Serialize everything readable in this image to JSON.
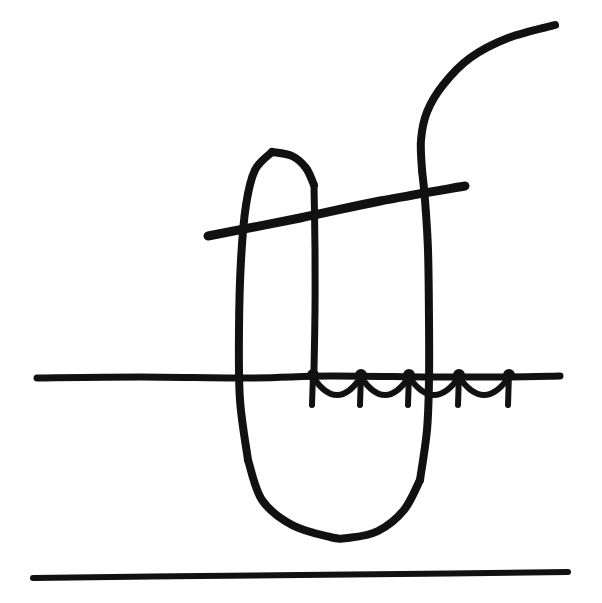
{
  "image": {
    "kind": "hand-drawn-sketch",
    "title": "Hand-drawn line sketch",
    "width": 602,
    "height": 603,
    "background_color": "#ffffff",
    "ink_color": "#111111",
    "text_content": "",
    "visible_labels": []
  },
  "chart_data": {
    "type": "line",
    "title": "",
    "xlabel": "",
    "ylabel": "",
    "grid": false,
    "legend": "none",
    "xlim": [
      0,
      602
    ],
    "ylim": [
      0,
      603
    ],
    "note": "Monochrome freehand ink drawing; no numeric axes, ticks, or labels are rendered in the image.",
    "strokes": [
      {
        "name": "ground-line",
        "description": "long near-horizontal baseline crossing the full width at mid height",
        "stroke_width": 7,
        "points": [
          [
            37,
            378
          ],
          [
            140,
            377
          ],
          [
            250,
            378
          ],
          [
            330,
            376
          ],
          [
            430,
            377
          ],
          [
            500,
            377
          ],
          [
            560,
            376
          ]
        ]
      },
      {
        "name": "bottom-line",
        "description": "straight horizontal rule near the bottom edge",
        "stroke_width": 6,
        "points": [
          [
            33,
            578
          ],
          [
            200,
            576
          ],
          [
            400,
            574
          ],
          [
            568,
            572
          ]
        ]
      },
      {
        "name": "slanted-line",
        "description": "thick line rising gently from lower-left to upper-right across the upper middle",
        "stroke_width": 9,
        "points": [
          [
            208,
            236
          ],
          [
            300,
            218
          ],
          [
            380,
            201
          ],
          [
            465,
            186
          ]
        ]
      },
      {
        "name": "u-loop-left",
        "description": "left flank of the tall narrow loop, from the rounded top apex down past the ground line",
        "stroke_width": 8,
        "points": [
          [
            272,
            152
          ],
          [
            255,
            170
          ],
          [
            246,
            205
          ],
          [
            241,
            260
          ],
          [
            239,
            330
          ],
          [
            240,
            400
          ],
          [
            248,
            460
          ]
        ]
      },
      {
        "name": "u-loop-bottom",
        "description": "rounded bottom of the tall loop",
        "stroke_width": 8,
        "points": [
          [
            248,
            460
          ],
          [
            262,
            500
          ],
          [
            292,
            525
          ],
          [
            330,
            537
          ],
          [
            348,
            538
          ],
          [
            378,
            531
          ],
          [
            404,
            510
          ],
          [
            420,
            480
          ]
        ]
      },
      {
        "name": "u-loop-right",
        "description": "right flank of the loop rising back up, continuing as the long vertical",
        "stroke_width": 8,
        "points": [
          [
            420,
            480
          ],
          [
            427,
            430
          ],
          [
            429,
            380
          ],
          [
            429,
            320
          ],
          [
            428,
            250
          ],
          [
            425,
            200
          ],
          [
            422,
            170
          ]
        ]
      },
      {
        "name": "inner-vertical",
        "description": "short vertical dropping from the loop apex down to the ground line",
        "stroke_width": 7,
        "points": [
          [
            314,
            185
          ],
          [
            315,
            250
          ],
          [
            315,
            310
          ],
          [
            314,
            370
          ]
        ]
      },
      {
        "name": "apex-to-inner-vertical",
        "description": "arc from the loop apex bending right into the inner vertical",
        "stroke_width": 8,
        "points": [
          [
            272,
            152
          ],
          [
            292,
            156
          ],
          [
            306,
            168
          ],
          [
            314,
            185
          ]
        ]
      },
      {
        "name": "top-right-hook",
        "description": "long curve sweeping up and to the right off the top of the vertical",
        "stroke_width": 8,
        "points": [
          [
            422,
            170
          ],
          [
            421,
            140
          ],
          [
            427,
            112
          ],
          [
            443,
            85
          ],
          [
            470,
            58
          ],
          [
            508,
            38
          ],
          [
            555,
            25
          ]
        ]
      }
    ],
    "fence": {
      "name": "barbed-wire-fence",
      "description": "row of knotted posts with drooping wire strung along the ground line",
      "baseline_y": 377,
      "post_stroke_width": 6,
      "wire_stroke_width": 6,
      "knot_radius": 6,
      "posts_x": [
        313,
        361,
        409,
        459,
        509
      ],
      "post_drop": 28,
      "wire_sag": 18,
      "spans": [
        [
          313,
          361
        ],
        [
          361,
          409
        ],
        [
          409,
          459
        ],
        [
          459,
          509
        ]
      ]
    }
  }
}
